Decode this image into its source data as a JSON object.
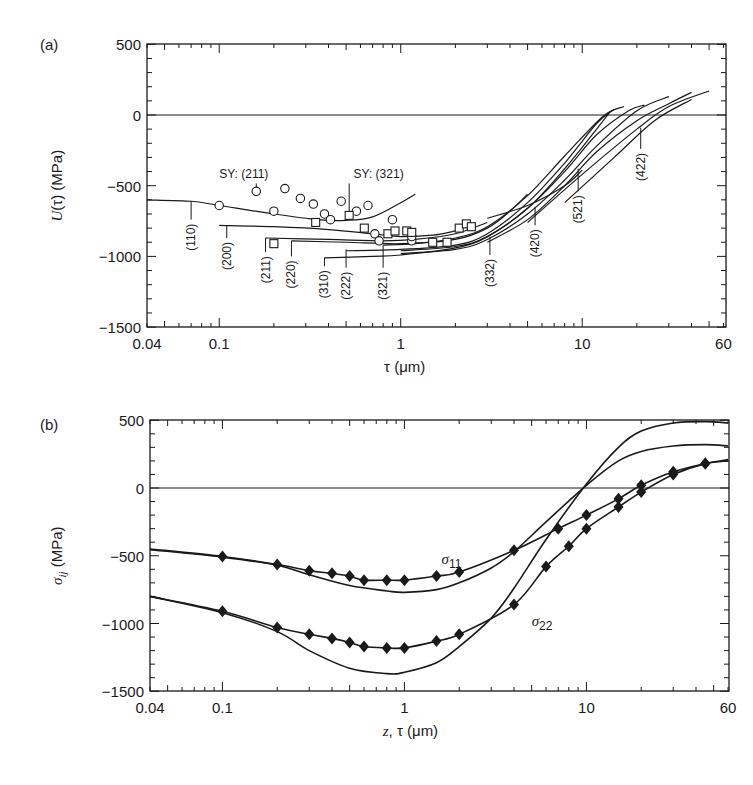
{
  "chart_data": [
    {
      "panel_label": "(a)",
      "type": "line",
      "title": "",
      "xlabel": "τ (μm)",
      "ylabel": "U(τ) (MPa)",
      "xscale": "log",
      "xlim": [
        0.04,
        60
      ],
      "ylim": [
        -1500,
        500
      ],
      "xticks": [
        {
          "v": 0.04,
          "label": "0.04"
        },
        {
          "v": 0.1,
          "label": "0.1"
        },
        {
          "v": 1,
          "label": "1"
        },
        {
          "v": 10,
          "label": "10"
        },
        {
          "v": 60,
          "label": "60"
        }
      ],
      "yticks": [
        {
          "v": 500,
          "label": "500"
        },
        {
          "v": 0,
          "label": "0"
        },
        {
          "v": -500,
          "label": "−500"
        },
        {
          "v": -1000,
          "label": "−1000"
        },
        {
          "v": -1500,
          "label": "−1500"
        }
      ],
      "reference_line": 0,
      "series": [
        {
          "name": "(110)",
          "x": [
            0.04,
            0.07,
            0.1,
            0.2,
            0.35,
            0.5,
            0.7,
            1.0,
            1.2
          ],
          "values": [
            -600,
            -610,
            -640,
            -700,
            -740,
            -745,
            -720,
            -620,
            -560
          ]
        },
        {
          "name": "(200)",
          "x": [
            0.1,
            0.2,
            0.4,
            0.7,
            1.0,
            1.5,
            2.0
          ],
          "values": [
            -780,
            -790,
            -810,
            -840,
            -860,
            -850,
            -820
          ]
        },
        {
          "name": "(211)",
          "x": [
            0.18,
            0.4,
            0.8,
            1.2,
            2.0,
            3.0
          ],
          "values": [
            -870,
            -880,
            -890,
            -880,
            -840,
            -760
          ]
        },
        {
          "name": "(220)",
          "x": [
            0.25,
            0.5,
            1.0,
            2.0,
            3.0,
            4.0,
            5.0
          ],
          "values": [
            -890,
            -900,
            -910,
            -880,
            -800,
            -680,
            -560
          ]
        },
        {
          "name": "(310)",
          "x": [
            0.38,
            0.7,
            1.0,
            2.0,
            3.0,
            5.0,
            8.0,
            12.0,
            14.0
          ],
          "values": [
            -1010,
            -1000,
            -990,
            -940,
            -860,
            -660,
            -380,
            -100,
            10
          ]
        },
        {
          "name": "(222)",
          "x": [
            0.5,
            1.0,
            2.0,
            3.0,
            5.0,
            8.0,
            12.0,
            15.0
          ],
          "values": [
            -960,
            -950,
            -920,
            -840,
            -620,
            -340,
            -60,
            40
          ]
        },
        {
          "name": "(321)",
          "x": [
            0.8,
            1.2,
            2.0,
            3.0,
            5.0,
            8.0,
            13.0,
            17.0
          ],
          "values": [
            -920,
            -910,
            -870,
            -790,
            -570,
            -290,
            -10,
            60
          ]
        },
        {
          "name": "(332)",
          "x": [
            1.0,
            2.0,
            3.0,
            5.0,
            8.0,
            12.0,
            18.0,
            22.0
          ],
          "values": [
            -960,
            -930,
            -860,
            -660,
            -400,
            -140,
            30,
            70
          ]
        },
        {
          "name": "(420)",
          "x": [
            1.0,
            2.0,
            3.0,
            5.0,
            8.0,
            12.0,
            20.0,
            30.0
          ],
          "values": [
            -980,
            -950,
            -880,
            -700,
            -460,
            -220,
            30,
            130
          ]
        },
        {
          "name": "(521)",
          "x": [
            3.0,
            5.0,
            8.0,
            10.0
          ],
          "values": [
            -730,
            -640,
            -500,
            -390
          ]
        },
        {
          "name": "(422)",
          "x": [
            3.0,
            5.0,
            8.0,
            12.0,
            20.0,
            30.0,
            40.0
          ],
          "values": [
            -900,
            -740,
            -500,
            -260,
            -40,
            80,
            160
          ]
        },
        {
          "name": "upper-tail",
          "x": [
            5.0,
            10.0,
            20.0,
            30.0,
            50.0
          ],
          "values": [
            -760,
            -420,
            -100,
            60,
            170
          ]
        },
        {
          "name": "upper-tail-2",
          "x": [
            8.0,
            15.0,
            25.0,
            40.0
          ],
          "values": [
            -620,
            -300,
            -40,
            110
          ]
        }
      ],
      "markers": {
        "circles": [
          {
            "x": 0.1,
            "y": -640
          },
          {
            "x": 0.16,
            "y": -540
          },
          {
            "x": 0.2,
            "y": -680
          },
          {
            "x": 0.23,
            "y": -520
          },
          {
            "x": 0.28,
            "y": -590
          },
          {
            "x": 0.33,
            "y": -630
          },
          {
            "x": 0.38,
            "y": -700
          },
          {
            "x": 0.41,
            "y": -740
          },
          {
            "x": 0.47,
            "y": -610
          },
          {
            "x": 0.57,
            "y": -680
          },
          {
            "x": 0.66,
            "y": -640
          },
          {
            "x": 0.72,
            "y": -840
          },
          {
            "x": 0.76,
            "y": -890
          },
          {
            "x": 0.9,
            "y": -740
          },
          {
            "x": 1.15,
            "y": -890
          },
          {
            "x": 1.15,
            "y": -860
          }
        ],
        "squares": [
          {
            "x": 0.2,
            "y": -910
          },
          {
            "x": 0.34,
            "y": -760
          },
          {
            "x": 0.52,
            "y": -710
          },
          {
            "x": 0.63,
            "y": -800
          },
          {
            "x": 0.85,
            "y": -840
          },
          {
            "x": 0.93,
            "y": -820
          },
          {
            "x": 1.08,
            "y": -820
          },
          {
            "x": 1.15,
            "y": -830
          },
          {
            "x": 1.5,
            "y": -900
          },
          {
            "x": 1.8,
            "y": -900
          },
          {
            "x": 2.1,
            "y": -800
          },
          {
            "x": 2.3,
            "y": -770
          },
          {
            "x": 2.45,
            "y": -790
          }
        ]
      },
      "annotations": [
        {
          "text": "SY: (211)",
          "x": 0.16,
          "y": -540,
          "tx": 0.1,
          "ty": -420
        },
        {
          "text": "SY: (321)",
          "x": 0.52,
          "y": -710,
          "tx": 0.55,
          "ty": -420
        }
      ],
      "hkl_labels": [
        {
          "text": "(110)",
          "x": 0.07,
          "y_line_top": -610,
          "y_line_bottom": -740
        },
        {
          "text": "(200)",
          "x": 0.11,
          "y_line_top": -780,
          "y_line_bottom": -870
        },
        {
          "text": "(211)",
          "x": 0.18,
          "y_line_top": -870,
          "y_line_bottom": -970
        },
        {
          "text": "(220)",
          "x": 0.25,
          "y_line_top": -890,
          "y_line_bottom": -1000
        },
        {
          "text": "(310)",
          "x": 0.38,
          "y_line_top": -1010,
          "y_line_bottom": -1070
        },
        {
          "text": "(222)",
          "x": 0.5,
          "y_line_top": -950,
          "y_line_bottom": -1080
        },
        {
          "text": "(321)",
          "x": 0.8,
          "y_line_top": -920,
          "y_line_bottom": -1080
        },
        {
          "text": "(332)",
          "x": 3.1,
          "y_line_top": -860,
          "y_line_bottom": -990
        },
        {
          "text": "(420)",
          "x": 5.5,
          "y_line_top": -650,
          "y_line_bottom": -780
        },
        {
          "text": "(521)",
          "x": 9.5,
          "y_line_top": -380,
          "y_line_bottom": -540
        },
        {
          "text": "(422)",
          "x": 21.0,
          "y_line_top": -90,
          "y_line_bottom": -240
        }
      ]
    },
    {
      "panel_label": "(b)",
      "type": "line",
      "title": "",
      "xlabel": "z, τ (μm)",
      "ylabel": "σij (MPa)",
      "xscale": "log",
      "xlim": [
        0.04,
        60
      ],
      "ylim": [
        -1500,
        500
      ],
      "xticks": [
        {
          "v": 0.04,
          "label": "0.04"
        },
        {
          "v": 0.1,
          "label": "0.1"
        },
        {
          "v": 1,
          "label": "1"
        },
        {
          "v": 10,
          "label": "10"
        },
        {
          "v": 60,
          "label": "60"
        }
      ],
      "yticks": [
        {
          "v": 500,
          "label": "500"
        },
        {
          "v": 0,
          "label": "0"
        },
        {
          "v": -500,
          "label": "−500"
        },
        {
          "v": -1000,
          "label": "−1000"
        },
        {
          "v": -1500,
          "label": "−1500"
        }
      ],
      "reference_line": 0,
      "series": [
        {
          "name": "σ11 (τ, markers)",
          "x": [
            0.04,
            0.1,
            0.2,
            0.3,
            0.4,
            0.5,
            0.6,
            0.8,
            1.0,
            1.5,
            2.0,
            4.0,
            7.0,
            10.0,
            15.0,
            20.0,
            30.0,
            45.0,
            60.0
          ],
          "values": [
            -450,
            -505,
            -565,
            -610,
            -630,
            -650,
            -680,
            -680,
            -680,
            -650,
            -620,
            -460,
            -300,
            -200,
            -80,
            20,
            120,
            180,
            210
          ],
          "marker_idx": [
            1,
            2,
            3,
            4,
            5,
            6,
            7,
            8,
            9,
            10,
            11,
            12,
            13,
            14,
            15,
            16,
            17
          ]
        },
        {
          "name": "σ11 (z, smooth)",
          "x": [
            0.04,
            0.1,
            0.2,
            0.3,
            0.5,
            0.8,
            1.0,
            1.5,
            2.0,
            3.0,
            4.0,
            6.0,
            10.0,
            15.0,
            20.0,
            30.0,
            45.0,
            60.0
          ],
          "values": [
            -455,
            -510,
            -570,
            -640,
            -720,
            -760,
            -770,
            -750,
            -700,
            -590,
            -470,
            -250,
            20,
            200,
            270,
            310,
            320,
            310
          ]
        },
        {
          "name": "σ22 (τ, markers)",
          "x": [
            0.04,
            0.1,
            0.2,
            0.3,
            0.4,
            0.5,
            0.6,
            0.8,
            1.0,
            1.5,
            2.0,
            4.0,
            6.0,
            8.0,
            10.0,
            15.0,
            20.0,
            30.0,
            45.0,
            60.0
          ],
          "values": [
            -800,
            -910,
            -1030,
            -1080,
            -1110,
            -1140,
            -1170,
            -1180,
            -1180,
            -1130,
            -1080,
            -860,
            -580,
            -430,
            -300,
            -140,
            -30,
            100,
            180,
            200
          ],
          "marker_idx": [
            1,
            2,
            3,
            4,
            5,
            6,
            7,
            8,
            9,
            10,
            11,
            12,
            13,
            14,
            15,
            16,
            17,
            18
          ]
        },
        {
          "name": "σ22 (z, smooth)",
          "x": [
            0.04,
            0.1,
            0.2,
            0.3,
            0.5,
            0.8,
            1.0,
            1.5,
            2.0,
            3.0,
            4.0,
            6.0,
            10.0,
            15.0,
            20.0,
            30.0,
            45.0,
            60.0
          ],
          "values": [
            -800,
            -920,
            -1060,
            -1200,
            -1330,
            -1370,
            -1360,
            -1290,
            -1170,
            -960,
            -740,
            -380,
            30,
            300,
            420,
            480,
            490,
            480
          ]
        }
      ],
      "annotations": [
        {
          "text": "σ11",
          "x": 1.6,
          "y": -560
        },
        {
          "text": "σ22",
          "x": 5.0,
          "y": -1020
        }
      ]
    }
  ]
}
